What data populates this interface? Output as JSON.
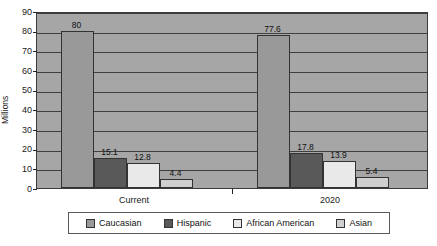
{
  "chart_data": {
    "type": "bar",
    "title": "",
    "subtitle": "",
    "xlabel": "",
    "ylabel": "Millions",
    "ylim": [
      0,
      90
    ],
    "ytick_values": [
      0,
      10,
      20,
      30,
      40,
      50,
      60,
      70,
      80,
      90
    ],
    "ytick_labels": [
      "0",
      "10",
      "20",
      "30",
      "40",
      "50",
      "60",
      "70",
      "80",
      "90"
    ],
    "grid": true,
    "grid_axis": "y",
    "legend_position": "bottom",
    "categories": [
      "Current",
      "2020"
    ],
    "series": [
      {
        "name": "Caucasian",
        "color": "#999999",
        "values": [
          80,
          77.6
        ],
        "data_labels": [
          "80",
          "77.6"
        ]
      },
      {
        "name": "Hispanic",
        "color": "#595959",
        "values": [
          15.1,
          17.8
        ],
        "data_labels": [
          "15.1",
          "17.8"
        ]
      },
      {
        "name": "African American",
        "color": "#e9e9e9",
        "values": [
          12.8,
          13.9
        ],
        "data_labels": [
          "12.8",
          "13.9"
        ]
      },
      {
        "name": "Asian",
        "color": "#cfcfcf",
        "values": [
          4.4,
          5.4
        ],
        "data_labels": [
          "4.4",
          "5.4"
        ]
      }
    ],
    "plot_background": "#a6a6a6",
    "figure_background": "#ffffff",
    "gridline_color": "#3f3f3f",
    "axis_color": "#333333"
  }
}
